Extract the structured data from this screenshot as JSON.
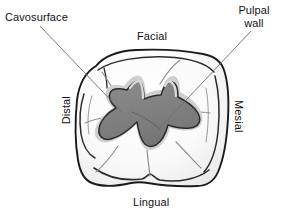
{
  "labels": {
    "cavosurface": "Cavosurface",
    "pulpal_wall_line1": "Pulpal",
    "pulpal_wall_line2": "wall",
    "facial": "Facial",
    "lingual": "Lingual",
    "distal": "Distal",
    "mesial": "Mesial"
  },
  "colors": {
    "background": "#ffffff",
    "tooth_fill": "#fbfbfb",
    "tooth_shade": "#ebebeb",
    "tooth_outline": "#1b1b1b",
    "cavity_fill": "#7d7d7d",
    "cavity_outline": "#2b2b2b",
    "cavity_bevel": "#c9c9c9",
    "fissure_line": "#8d8d8d",
    "leader_line": "#6e6e6e",
    "text": "#111111"
  },
  "leader_lines": [
    {
      "name": "cavosurface-leader",
      "from_label": "Cavosurface",
      "x1": 40,
      "y1": 26,
      "x2": 123,
      "y2": 113
    },
    {
      "name": "pulpal-wall-leader",
      "from_label": "Pulpal wall",
      "x1": 251,
      "y1": 31,
      "x2": 157,
      "y2": 131
    }
  ],
  "anatomy": {
    "tooth_crown_outline": "irregular rounded-square occlusal outline of a molar crown",
    "cavity_preparation": "star/amoeba-shaped class I occlusal preparation following the fissure pattern",
    "orientation": {
      "top": "Facial",
      "bottom": "Lingual",
      "left": "Distal",
      "right": "Mesial"
    }
  }
}
